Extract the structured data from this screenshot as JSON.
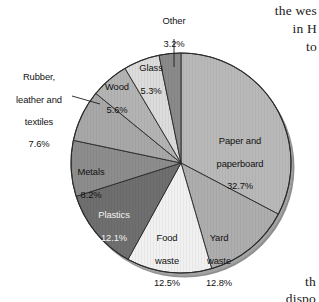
{
  "figure": {
    "background_color": "#ffffff",
    "geometry": {
      "center_x": 181,
      "center_y": 163,
      "radius": 110,
      "start_angle_deg": 0,
      "direction": "clockwise",
      "depth_px": 7
    }
  },
  "chart_data": {
    "type": "pie",
    "title": "",
    "subtitle": "",
    "xlabel": "",
    "ylabel": "",
    "grid": false,
    "legend_position": "none",
    "label_format": "name + percent",
    "total_percent": 100.0,
    "categories": [
      "Paper and paperboard",
      "Yard waste",
      "Food waste",
      "Plastics",
      "Metals",
      "Rubber, leather and textiles",
      "Wood",
      "Glass",
      "Other"
    ],
    "values": [
      32.7,
      12.8,
      12.5,
      12.1,
      8.2,
      7.6,
      5.6,
      5.3,
      3.2
    ],
    "colors": [
      "#b9b9b9",
      "#aeaeae",
      "#f1f1f1",
      "#6f6f6f",
      "#8d8d8d",
      "#a8a8a8",
      "#b4b4b4",
      "#dcdcdc",
      "#8a8a8a"
    ],
    "slices": [
      {
        "label": "Paper and\npaperboard\n32.7%",
        "name": "Paper and paperboard",
        "percent": 32.7,
        "color": "#b9b9b9"
      },
      {
        "label": "Yard\nwaste\n12.8%",
        "name": "Yard waste",
        "percent": 12.8,
        "color": "#aeaeae"
      },
      {
        "label": "Food\nwaste\n12.5%",
        "name": "Food waste",
        "percent": 12.5,
        "color": "#f1f1f1"
      },
      {
        "label": "Plastics\n12.1%",
        "name": "Plastics",
        "percent": 12.1,
        "color": "#6f6f6f"
      },
      {
        "label": "Metals\n8.2%",
        "name": "Metals",
        "percent": 8.2,
        "color": "#8d8d8d"
      },
      {
        "label": "Rubber,\nleather and\ntextiles\n7.6%",
        "name": "Rubber, leather and textiles",
        "percent": 7.6,
        "color": "#a8a8a8"
      },
      {
        "label": "Wood\n5.6%",
        "name": "Wood",
        "percent": 5.6,
        "color": "#b4b4b4"
      },
      {
        "label": "Glass\n5.3%",
        "name": "Glass",
        "percent": 5.3,
        "color": "#dcdcdc"
      },
      {
        "label": "Other\n3.2%",
        "name": "Other",
        "percent": 3.2,
        "color": "#8a8a8a"
      }
    ]
  },
  "labels": {
    "paper": {
      "line1": "Paper and",
      "line2": "paperboard",
      "line3": "32.7%"
    },
    "yard": {
      "line1": "Yard",
      "line2": "waste",
      "line3": "12.8%"
    },
    "food": {
      "line1": "Food",
      "line2": "waste",
      "line3": "12.5%"
    },
    "plastics": {
      "line1": "Plastics",
      "line2": "12.1%"
    },
    "metals": {
      "line1": "Metals",
      "line2": "8.2%"
    },
    "rubber": {
      "line1": "Rubber,",
      "line2": "leather and",
      "line3": "textiles",
      "line4": "7.6%"
    },
    "wood": {
      "line1": "Wood",
      "line2": "5.6%"
    },
    "glass": {
      "line1": "Glass",
      "line2": "5.3%"
    },
    "other": {
      "line1": "Other",
      "line2": "3.2%"
    }
  },
  "page_text": {
    "right_line1": "the wes",
    "right_line2": "in H",
    "right_line3": "to",
    "bottom_line1": "th",
    "bottom_line2": "dispo"
  }
}
